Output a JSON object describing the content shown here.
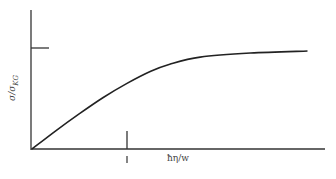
{
  "chart_data": {
    "type": "line",
    "title": "",
    "xlabel": "ħη/w",
    "ylabel": "σ/σ_KG",
    "ylabel_main": "σ/σ",
    "ylabel_sub": "KG",
    "x_ticks": [
      "1"
    ],
    "y_ticks": [
      "1"
    ],
    "xlim": [
      0,
      3.07
    ],
    "ylim": [
      0,
      1.38
    ],
    "grid": false,
    "legend": null,
    "series": [
      {
        "name": "σ/σ_KG",
        "x": [
          0,
          0.25,
          0.5,
          0.75,
          1.0,
          1.25,
          1.45,
          1.77,
          2.3,
          2.9
        ],
        "y": [
          0,
          0.18,
          0.35,
          0.51,
          0.65,
          0.77,
          0.84,
          0.91,
          0.95,
          0.97
        ]
      }
    ]
  }
}
